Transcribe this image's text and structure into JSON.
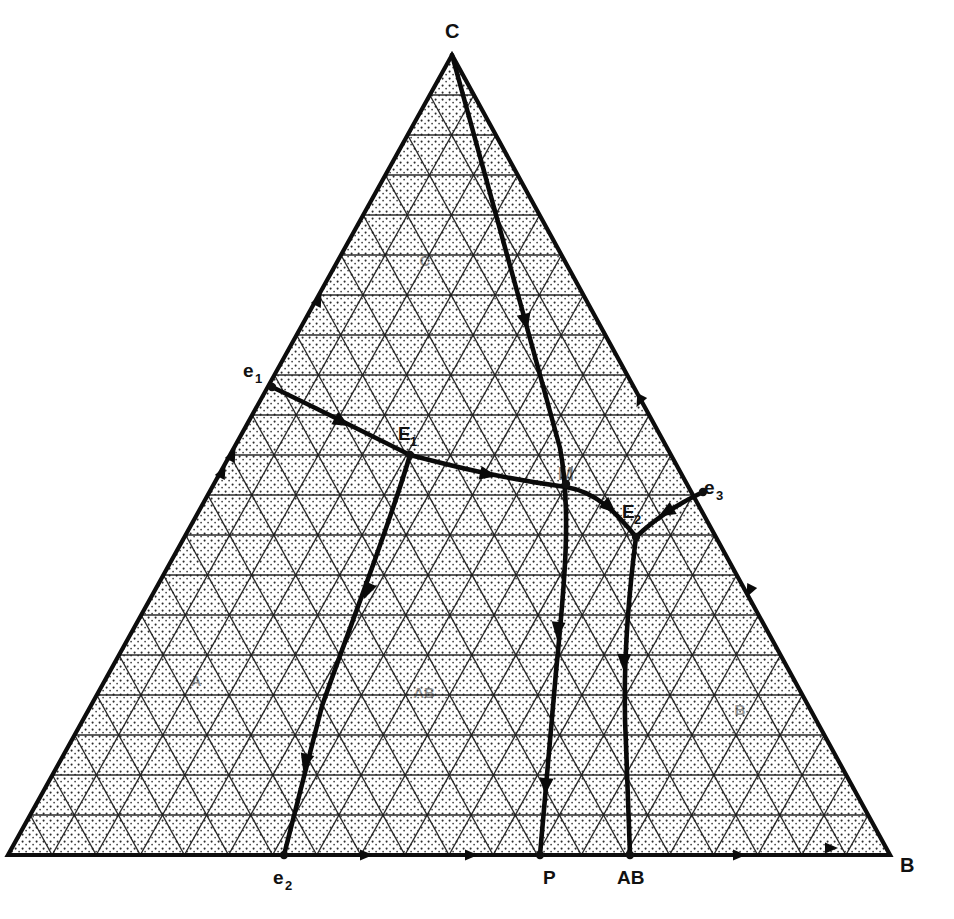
{
  "figure": {
    "type": "ternary-phase-diagram",
    "background_color": "#ffffff",
    "line_color": "#0a0a0a",
    "grid_divisions": 20
  },
  "vertices": [
    {
      "id": "C",
      "label": "C",
      "x": 452,
      "y": 55,
      "label_x": 445,
      "label_y": 38
    },
    {
      "id": "A",
      "label": "",
      "x": 8,
      "y": 855,
      "label_x": 0,
      "label_y": 872
    },
    {
      "id": "B",
      "label": "B",
      "x": 890,
      "y": 855,
      "label_x": 900,
      "label_y": 872
    }
  ],
  "points": [
    {
      "id": "e1",
      "base": "e",
      "sub": "1",
      "x": 272,
      "y": 387,
      "label_x": 243,
      "label_y": 377
    },
    {
      "id": "e2",
      "base": "e",
      "sub": "2",
      "x": 284,
      "y": 855,
      "label_x": 273,
      "label_y": 884
    },
    {
      "id": "e3",
      "base": "e",
      "sub": "3",
      "x": 703,
      "y": 492,
      "label_x": 704,
      "label_y": 494
    },
    {
      "id": "E1",
      "base": "E",
      "sub": "1",
      "x": 410,
      "y": 455,
      "label_x": 398,
      "label_y": 440
    },
    {
      "id": "E2",
      "base": "E",
      "sub": "2",
      "x": 636,
      "y": 537,
      "label_x": 622,
      "label_y": 518
    },
    {
      "id": "P",
      "base": "P",
      "sub": "",
      "x": 540,
      "y": 855,
      "label_x": 543,
      "label_y": 884
    },
    {
      "id": "AB",
      "base": "AB",
      "sub": "",
      "x": 630,
      "y": 855,
      "label_x": 617,
      "label_y": 884
    },
    {
      "id": "M",
      "base": "M",
      "sub": "",
      "x": 566,
      "y": 484,
      "label_x": 558,
      "label_y": 480
    }
  ],
  "field_labels": [
    {
      "id": "field-C",
      "label": "C",
      "x": 425,
      "y": 266
    },
    {
      "id": "field-A",
      "label": "A",
      "x": 196,
      "y": 686
    },
    {
      "id": "field-AB",
      "label": "AB",
      "x": 424,
      "y": 698
    },
    {
      "id": "field-B",
      "label": "B",
      "x": 740,
      "y": 715
    }
  ],
  "boundaries": [
    {
      "id": "curve-e1-E1",
      "name": "e1-to-E1-boundary",
      "path": "M 272 387 C 318 409, 372 436, 410 455",
      "arrows": [
        {
          "x": 340,
          "y": 421,
          "angle": 29
        }
      ]
    },
    {
      "id": "curve-E1-E2",
      "name": "E1-to-E2-boundary",
      "path": "M 410 455 C 452 466, 500 478, 566 487 C 596 492, 616 512, 636 537",
      "arrows": [
        {
          "x": 486,
          "y": 474,
          "angle": 12
        },
        {
          "x": 608,
          "y": 506,
          "angle": 42
        }
      ]
    },
    {
      "id": "curve-e3-E2",
      "name": "e3-to-E2-boundary",
      "path": "M 703 492 C 684 501, 660 514, 636 537",
      "arrows": [
        {
          "x": 668,
          "y": 511,
          "angle": 150
        }
      ]
    },
    {
      "id": "curve-E1-e2",
      "name": "E1-to-e2-boundary",
      "path": "M 410 455 C 388 530, 352 620, 322 706 C 308 760, 294 814, 284 855",
      "arrows": [
        {
          "x": 368,
          "y": 589,
          "angle": 113
        },
        {
          "x": 306,
          "y": 760,
          "angle": 105
        }
      ]
    },
    {
      "id": "curve-C-P",
      "name": "C-to-P-boundary",
      "path": "M 452 55 C 486 175, 524 318, 560 448 C 572 512, 564 590, 556 672 C 550 744, 544 806, 540 855",
      "arrows": [
        {
          "x": 525,
          "y": 320,
          "angle": 76
        },
        {
          "x": 558,
          "y": 628,
          "angle": 96
        },
        {
          "x": 546,
          "y": 784,
          "angle": 95
        }
      ]
    },
    {
      "id": "curve-E2-AB",
      "name": "E2-to-AB-boundary",
      "path": "M 636 537 C 628 600, 622 672, 626 744 C 628 790, 629 826, 630 855",
      "arrows": [
        {
          "x": 624,
          "y": 660,
          "angle": 92
        }
      ]
    }
  ],
  "edge_markers": [
    {
      "id": "marker-left-1",
      "x": 318,
      "y": 301,
      "angle": -64
    },
    {
      "id": "marker-left-2",
      "x": 232,
      "y": 456,
      "angle": -64
    },
    {
      "id": "marker-left-3",
      "x": 222,
      "y": 473,
      "angle": -64
    },
    {
      "id": "marker-right-1",
      "x": 640,
      "y": 400,
      "angle": 116
    },
    {
      "id": "marker-right-2",
      "x": 750,
      "y": 590,
      "angle": 116
    },
    {
      "id": "marker-base-1",
      "x": 365,
      "y": 855,
      "angle": 0
    },
    {
      "id": "marker-base-2",
      "x": 470,
      "y": 855,
      "angle": 0
    },
    {
      "id": "marker-base-3",
      "x": 738,
      "y": 855,
      "angle": 0
    },
    {
      "id": "marker-base-4",
      "x": 830,
      "y": 848,
      "angle": 0
    }
  ]
}
